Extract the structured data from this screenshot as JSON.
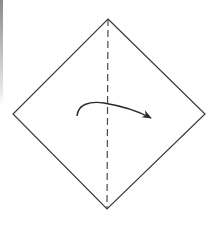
{
  "diagram": {
    "type": "origami-fold-step",
    "colors": {
      "background": "#ffffff",
      "line": "#3a3a3a",
      "dash": "#4a4a4a",
      "arrow": "#2a2a2a",
      "edge_strip": "#9a9a9a"
    },
    "paper": {
      "shape": "diamond",
      "vertices": {
        "top": [
          108,
          19
        ],
        "right": [
          205,
          114
        ],
        "bottom": [
          107,
          209
        ],
        "left": [
          13,
          114
        ]
      }
    },
    "fold_line": {
      "style": "dashed",
      "kind": "valley-fold",
      "from": [
        108,
        19
      ],
      "to": [
        107,
        209
      ],
      "dash": "7 4"
    },
    "arrow": {
      "direction": "left-to-right",
      "start": [
        77,
        116
      ],
      "peak": [
        100,
        103
      ],
      "end": [
        151,
        118
      ],
      "head": "filled"
    }
  }
}
